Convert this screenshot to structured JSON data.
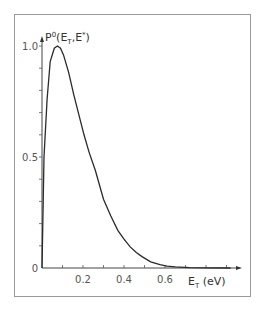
{
  "chart_data": {
    "type": "line",
    "title": "",
    "xlabel": "E_T (eV)",
    "ylabel": "P^0(E_T,E*)",
    "xlabel_parts": {
      "main": "E",
      "sub": "T",
      "unit": "(eV)"
    },
    "ylabel_parts": {
      "main": "P",
      "sup": "0",
      "open": "(E",
      "sub": "T",
      "mid": ",E",
      "sup2": "*",
      "close": ")"
    },
    "xlim": [
      0,
      0.95
    ],
    "ylim": [
      0,
      1.0
    ],
    "x_ticks": [
      0.1,
      0.2,
      0.3,
      0.4,
      0.5,
      0.6,
      0.7,
      0.8,
      0.9
    ],
    "x_tick_labels": [
      {
        "value": 0,
        "label": "0"
      },
      {
        "value": 0.2,
        "label": "0.2"
      },
      {
        "value": 0.4,
        "label": "0.4"
      },
      {
        "value": 0.6,
        "label": "0.6"
      }
    ],
    "y_ticks": [
      0.1,
      0.2,
      0.3,
      0.4,
      0.5,
      0.6,
      0.7,
      0.8,
      0.9,
      1.0
    ],
    "y_tick_labels": [
      {
        "value": 0.5,
        "label": "0.5"
      },
      {
        "value": 1.0,
        "label": "1.0"
      }
    ],
    "grid": false,
    "legend": "none",
    "series": [
      {
        "name": "P0(ET,E*)",
        "x": [
          0,
          0.005,
          0.01,
          0.025,
          0.04,
          0.06,
          0.075,
          0.09,
          0.105,
          0.13,
          0.155,
          0.18,
          0.205,
          0.23,
          0.26,
          0.3,
          0.335,
          0.37,
          0.4,
          0.43,
          0.46,
          0.49,
          0.53,
          0.575,
          0.61,
          0.65,
          0.72,
          0.8,
          0.92
        ],
        "y": [
          0,
          0.25,
          0.5,
          0.76,
          0.93,
          0.99,
          1.0,
          0.99,
          0.96,
          0.88,
          0.78,
          0.69,
          0.6,
          0.52,
          0.44,
          0.31,
          0.235,
          0.17,
          0.13,
          0.095,
          0.07,
          0.05,
          0.028,
          0.015,
          0.008,
          0.005,
          0.002,
          0.001,
          0.0
        ]
      }
    ]
  }
}
